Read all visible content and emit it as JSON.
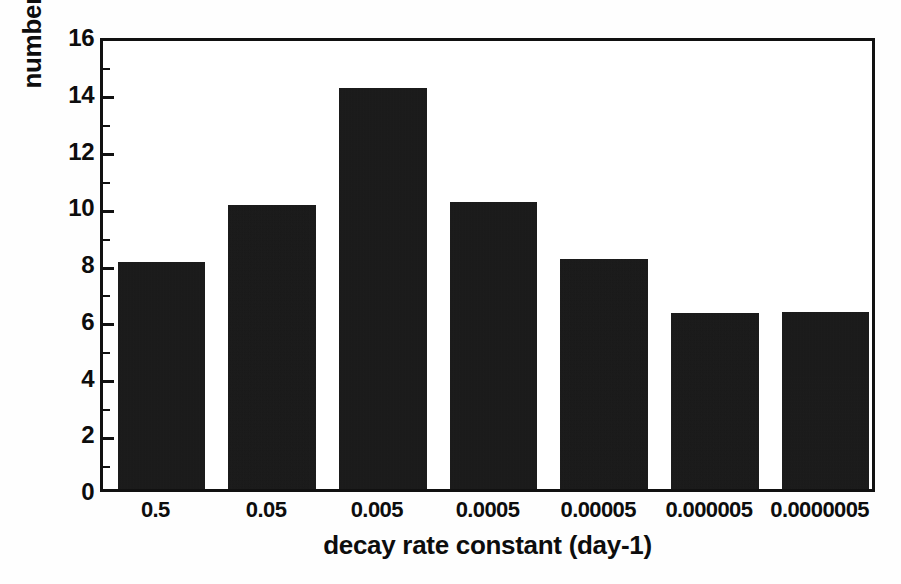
{
  "chart_data": {
    "type": "bar",
    "title": "",
    "subtitle": "",
    "xlabel": "decay rate constant (day-1)",
    "ylabel": "number of pools",
    "categories": [
      "0.5",
      "0.05",
      "0.005",
      "0.0005",
      "0.00005",
      "0.000005",
      "0.0000005"
    ],
    "values": [
      8.0,
      10.0,
      14.15,
      10.1,
      8.1,
      6.2,
      6.25
    ],
    "series": [
      {
        "name": "number of pools",
        "values": [
          8.0,
          10.0,
          14.15,
          10.1,
          8.1,
          6.2,
          6.25
        ]
      }
    ],
    "ylim": [
      0,
      16
    ],
    "ytick_major": [
      0,
      2,
      4,
      6,
      8,
      10,
      12,
      14,
      16
    ],
    "ytick_minor": [
      1,
      3,
      5,
      7,
      9,
      11,
      13,
      15
    ],
    "ytick_labels": [
      "0",
      "2",
      "4",
      "6",
      "8",
      "10",
      "12",
      "14",
      "16"
    ],
    "grid": false,
    "legend": false,
    "legend_position": "none",
    "bar_color": "#141414",
    "axis_color": "#111111",
    "background_color": "#ffffff",
    "annotations": []
  }
}
